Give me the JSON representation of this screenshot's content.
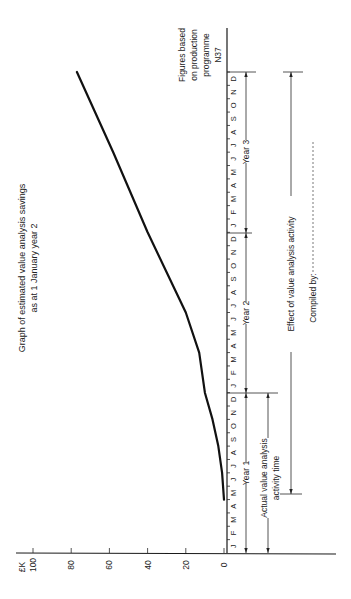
{
  "chart_data": {
    "type": "line",
    "orientation": "rotated 90 degrees counter-clockwise (time runs bottom-to-top, value runs right-to-left)",
    "title": "Graph of estimated value analysis savings",
    "subtitle": "as at 1 January year 2",
    "xlabel": "Month (Year 1 – Year 3)",
    "ylabel": "£K",
    "ylim": [
      0,
      100
    ],
    "y_ticks": [
      0,
      20,
      40,
      60,
      80,
      100
    ],
    "months": [
      "J",
      "F",
      "M",
      "A",
      "M",
      "J",
      "J",
      "A",
      "S",
      "O",
      "N",
      "D"
    ],
    "years": [
      "Year 1",
      "Year 2",
      "Year 3"
    ],
    "x": [
      "Y1-Jan",
      "Y1-May",
      "Y1-Jul",
      "Y1-Sep",
      "Y1-Dec",
      "Y2-Mar",
      "Y2-Jun",
      "Y2-Dec",
      "Y3-Jun",
      "Y3-Dec"
    ],
    "series": [
      {
        "name": "Estimated value analysis savings (£K)",
        "points": [
          {
            "month_index": 4,
            "value": 0
          },
          {
            "month_index": 6,
            "value": 1
          },
          {
            "month_index": 8,
            "value": 3
          },
          {
            "month_index": 10,
            "value": 6
          },
          {
            "month_index": 12,
            "value": 10
          },
          {
            "month_index": 15,
            "value": 13
          },
          {
            "month_index": 18,
            "value": 20
          },
          {
            "month_index": 24,
            "value": 40
          },
          {
            "month_index": 30,
            "value": 58
          },
          {
            "month_index": 36,
            "value": 77
          }
        ]
      }
    ],
    "annotations": [
      {
        "text": "Figures based on production programme N37"
      },
      {
        "text": "Actual value analysis activity time",
        "span": "Y1-Jan to Y1-Dec"
      },
      {
        "text": "Effect of value analysis activity",
        "span": "Y1-May to Y3-Dec"
      },
      {
        "text": "Compiled by:"
      }
    ],
    "grid": false,
    "legend": "none"
  },
  "labels": {
    "title_line1": "Graph of estimated value analysis savings",
    "title_line2": "as at 1 January year 2",
    "unit": "£K",
    "tick_0": "0",
    "tick_20": "20",
    "tick_40": "40",
    "tick_60": "60",
    "tick_80": "80",
    "tick_100": "100",
    "year1": "Year 1",
    "year2": "Year 2",
    "year3": "Year 3",
    "figures_line1": "Figures based",
    "figures_line2": "on production",
    "figures_line3": "programme",
    "figures_line4": "N37",
    "actual_line1": "Actual value analysis",
    "actual_line2": "activity time",
    "effect": "Effect of value analysis activity",
    "compiled": "Compiled by:",
    "m": [
      "J",
      "F",
      "M",
      "A",
      "M",
      "J",
      "J",
      "A",
      "S",
      "O",
      "N",
      "D"
    ]
  }
}
